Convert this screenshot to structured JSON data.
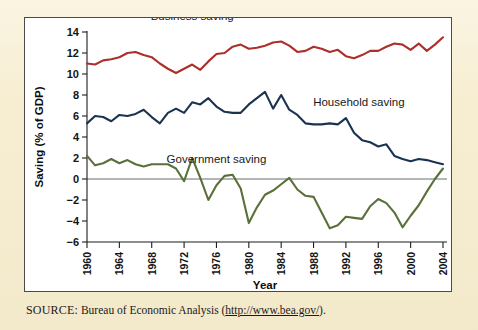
{
  "figure": {
    "source_label": "SOURCE:",
    "source_text": " Bureau of Economic Analysis (",
    "source_url": "http://www.bea.gov/",
    "source_tail": ")."
  },
  "colors": {
    "mat_background": "#f7eed2",
    "plot_background": "#ffffff",
    "panel_border": "#4a4a48",
    "business": "#ad2f29",
    "household": "#1b3350",
    "government": "#5a7039",
    "axis": "#1d1d1d",
    "zero_line": "#6d6d6d"
  },
  "chart_data": {
    "type": "line",
    "title": "",
    "xlabel": "Year",
    "ylabel": "Saving (% of GDP)",
    "xlim": [
      1960,
      2004
    ],
    "ylim": [
      -6,
      14
    ],
    "yticks": [
      -6,
      -4,
      -2,
      0,
      2,
      4,
      6,
      8,
      10,
      12,
      14
    ],
    "ytick_labels": [
      "−6",
      "−4",
      "−2",
      "0",
      "2",
      "4",
      "6",
      "8",
      "10",
      "12",
      "14"
    ],
    "xticks": [
      1960,
      1964,
      1968,
      1972,
      1976,
      1980,
      1984,
      1988,
      1992,
      1996,
      2000,
      2004
    ],
    "xtick_labels": [
      "1960",
      "1964",
      "1968",
      "1972",
      "1976",
      "1980",
      "1984",
      "1988",
      "1992",
      "1996",
      "2000",
      "2004"
    ],
    "grid": false,
    "legend": "inline-annotations",
    "x": [
      1960,
      1961,
      1962,
      1963,
      1964,
      1965,
      1966,
      1967,
      1968,
      1969,
      1970,
      1971,
      1972,
      1973,
      1974,
      1975,
      1976,
      1977,
      1978,
      1979,
      1980,
      1981,
      1982,
      1983,
      1984,
      1985,
      1986,
      1987,
      1988,
      1989,
      1990,
      1991,
      1992,
      1993,
      1994,
      1995,
      1996,
      1997,
      1998,
      1999,
      2000,
      2001,
      2002,
      2003,
      2004
    ],
    "series": [
      {
        "name": "Business saving",
        "color": "#ad2f29",
        "label_x": 1973.0,
        "label_y": 15.1,
        "values": [
          11.0,
          10.9,
          11.3,
          11.4,
          11.6,
          12.0,
          12.1,
          11.8,
          11.6,
          11.0,
          10.5,
          10.1,
          10.5,
          10.9,
          10.4,
          11.2,
          11.9,
          12.0,
          12.6,
          12.8,
          12.4,
          12.5,
          12.7,
          13.0,
          13.1,
          12.7,
          12.1,
          12.2,
          12.6,
          12.4,
          12.1,
          12.3,
          11.7,
          11.5,
          11.8,
          12.2,
          12.2,
          12.6,
          12.9,
          12.8,
          12.3,
          12.9,
          12.2,
          12.8,
          13.5
        ],
        "annotation_offset": {
          "dx": 0,
          "dy": 0
        }
      },
      {
        "name": "Household saving",
        "color": "#1b3350",
        "label_x": 1993.6,
        "label_y": 7.0,
        "values": [
          5.3,
          6.0,
          5.9,
          5.5,
          6.1,
          6.0,
          6.2,
          6.6,
          5.9,
          5.3,
          6.3,
          6.7,
          6.3,
          7.3,
          7.1,
          7.7,
          6.9,
          6.4,
          6.3,
          6.3,
          7.1,
          7.7,
          8.3,
          6.7,
          8.0,
          6.6,
          6.1,
          5.3,
          5.2,
          5.2,
          5.3,
          5.2,
          5.8,
          4.4,
          3.7,
          3.5,
          3.1,
          3.3,
          2.2,
          1.9,
          1.7,
          1.9,
          1.8,
          1.6,
          1.4
        ],
        "annotation_offset": {
          "dx": 0,
          "dy": 0
        }
      },
      {
        "name": "Government saving",
        "color": "#5a7039",
        "label_x": 1976.0,
        "label_y": 1.55,
        "values": [
          2.2,
          1.3,
          1.5,
          1.9,
          1.5,
          1.8,
          1.4,
          1.2,
          1.4,
          1.4,
          1.4,
          1.0,
          -0.2,
          2.0,
          0.1,
          -2.0,
          -0.6,
          0.3,
          0.4,
          -0.9,
          -4.2,
          -2.7,
          -1.5,
          -1.1,
          -0.5,
          0.1,
          -1.0,
          -1.6,
          -1.7,
          -3.2,
          -4.7,
          -4.4,
          -3.6,
          -3.7,
          -3.8,
          -2.6,
          -1.9,
          -2.3,
          -3.2,
          -4.6,
          -3.5,
          -2.5,
          -1.2,
          0.0,
          1.0
        ],
        "annotation_offset": {
          "dx": 0,
          "dy": 0
        }
      }
    ],
    "government_values_tail_note": "",
    "government_full": [
      2.2,
      1.3,
      1.5,
      1.9,
      1.5,
      1.8,
      1.4,
      1.2,
      1.4,
      1.4,
      1.4,
      1.0,
      -0.2,
      2.0,
      0.1,
      -2.0,
      -0.6,
      0.3,
      0.4,
      -0.9,
      -4.2,
      -2.7,
      -1.5,
      -1.1,
      -0.5,
      0.1,
      -1.0,
      -1.6,
      -1.7,
      -3.2,
      -4.7,
      -4.4,
      -3.6,
      -3.7,
      -3.8,
      -2.6,
      -1.9,
      -2.3,
      -3.2,
      -4.6,
      -3.5,
      -2.5,
      -1.2,
      0.0,
      1.0
    ]
  }
}
